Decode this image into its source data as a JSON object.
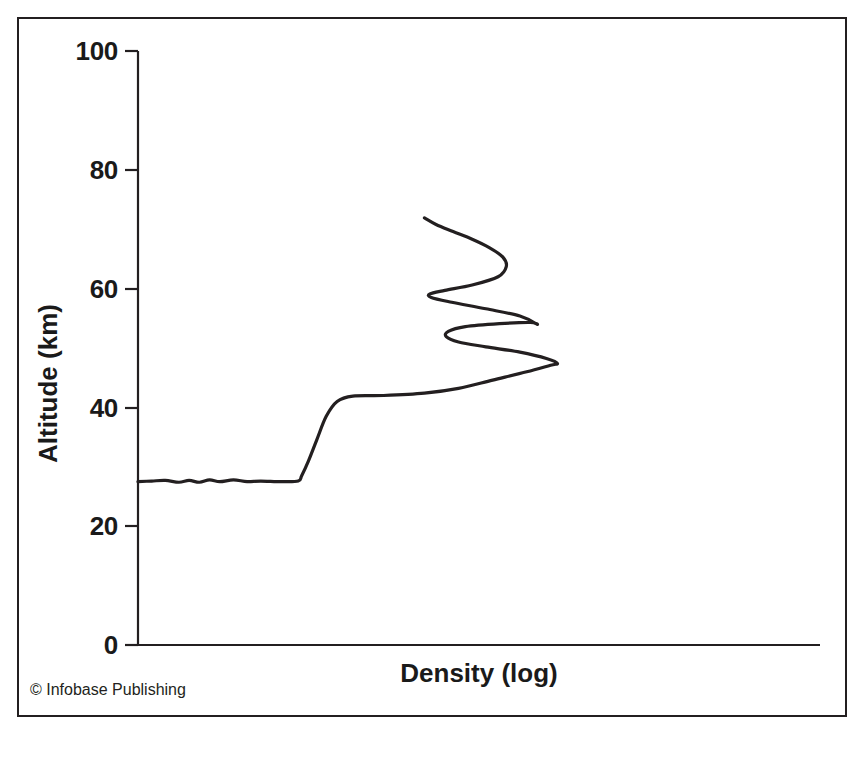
{
  "figure": {
    "credit": "© Infobase Publishing",
    "frame_color": "#231f20",
    "background": "#ffffff",
    "line_color": "#231f20"
  },
  "chart_data": {
    "type": "line",
    "title": "",
    "subtitle": "",
    "xlabel": "Density (log)",
    "ylabel": "Altitude (km)",
    "ylim": [
      0,
      100
    ],
    "xlim": [
      0,
      1
    ],
    "y_ticks": [
      0,
      20,
      40,
      60,
      80,
      100
    ],
    "y_tick_labels": [
      "0",
      "20",
      "40",
      "60",
      "80",
      "100"
    ],
    "x_ticks": [],
    "x_tick_labels": [],
    "grid": false,
    "legend": null,
    "annotations": [],
    "series": [
      {
        "name": "Density profile",
        "orientation": "x-as-density-y-as-altitude",
        "description": "Density (log) plotted horizontally against altitude; profile rises from about 27.5 km, steps up near 42 km, then folds back in an S-shaped double curl between roughly 47 and 72 km.",
        "points": [
          {
            "x": 0.0,
            "y": 27.5
          },
          {
            "x": 0.02,
            "y": 27.6
          },
          {
            "x": 0.04,
            "y": 27.7
          },
          {
            "x": 0.06,
            "y": 27.4
          },
          {
            "x": 0.075,
            "y": 27.7
          },
          {
            "x": 0.09,
            "y": 27.4
          },
          {
            "x": 0.105,
            "y": 27.8
          },
          {
            "x": 0.12,
            "y": 27.5
          },
          {
            "x": 0.14,
            "y": 27.8
          },
          {
            "x": 0.16,
            "y": 27.5
          },
          {
            "x": 0.18,
            "y": 27.6
          },
          {
            "x": 0.21,
            "y": 27.5
          },
          {
            "x": 0.235,
            "y": 27.6
          },
          {
            "x": 0.24,
            "y": 28.5
          },
          {
            "x": 0.25,
            "y": 31.0
          },
          {
            "x": 0.262,
            "y": 34.5
          },
          {
            "x": 0.276,
            "y": 38.5
          },
          {
            "x": 0.292,
            "y": 41.0
          },
          {
            "x": 0.315,
            "y": 41.9
          },
          {
            "x": 0.36,
            "y": 42.0
          },
          {
            "x": 0.42,
            "y": 42.4
          },
          {
            "x": 0.47,
            "y": 43.2
          },
          {
            "x": 0.52,
            "y": 44.6
          },
          {
            "x": 0.57,
            "y": 46.0
          },
          {
            "x": 0.605,
            "y": 47.1
          },
          {
            "x": 0.615,
            "y": 47.4
          },
          {
            "x": 0.6,
            "y": 48.2
          },
          {
            "x": 0.56,
            "y": 49.3
          },
          {
            "x": 0.51,
            "y": 50.2
          },
          {
            "x": 0.47,
            "y": 51.0
          },
          {
            "x": 0.452,
            "y": 51.9
          },
          {
            "x": 0.455,
            "y": 52.8
          },
          {
            "x": 0.48,
            "y": 53.6
          },
          {
            "x": 0.53,
            "y": 54.1
          },
          {
            "x": 0.575,
            "y": 54.3
          },
          {
            "x": 0.585,
            "y": 54.0
          },
          {
            "x": 0.56,
            "y": 55.4
          },
          {
            "x": 0.51,
            "y": 56.6
          },
          {
            "x": 0.46,
            "y": 57.7
          },
          {
            "x": 0.43,
            "y": 58.5
          },
          {
            "x": 0.428,
            "y": 59.1
          },
          {
            "x": 0.45,
            "y": 59.7
          },
          {
            "x": 0.49,
            "y": 60.6
          },
          {
            "x": 0.528,
            "y": 62.0
          },
          {
            "x": 0.54,
            "y": 63.7
          },
          {
            "x": 0.535,
            "y": 65.3
          },
          {
            "x": 0.515,
            "y": 66.9
          },
          {
            "x": 0.49,
            "y": 68.3
          },
          {
            "x": 0.462,
            "y": 69.6
          },
          {
            "x": 0.437,
            "y": 70.8
          },
          {
            "x": 0.42,
            "y": 71.9
          }
        ]
      }
    ]
  },
  "axes": {
    "y_title": "Altitude (km)",
    "x_title": "Density (log)",
    "labels": {
      "t100": "100",
      "t80": "80",
      "t60": "60",
      "t40": "40",
      "t20": "20",
      "t0": "0"
    }
  }
}
